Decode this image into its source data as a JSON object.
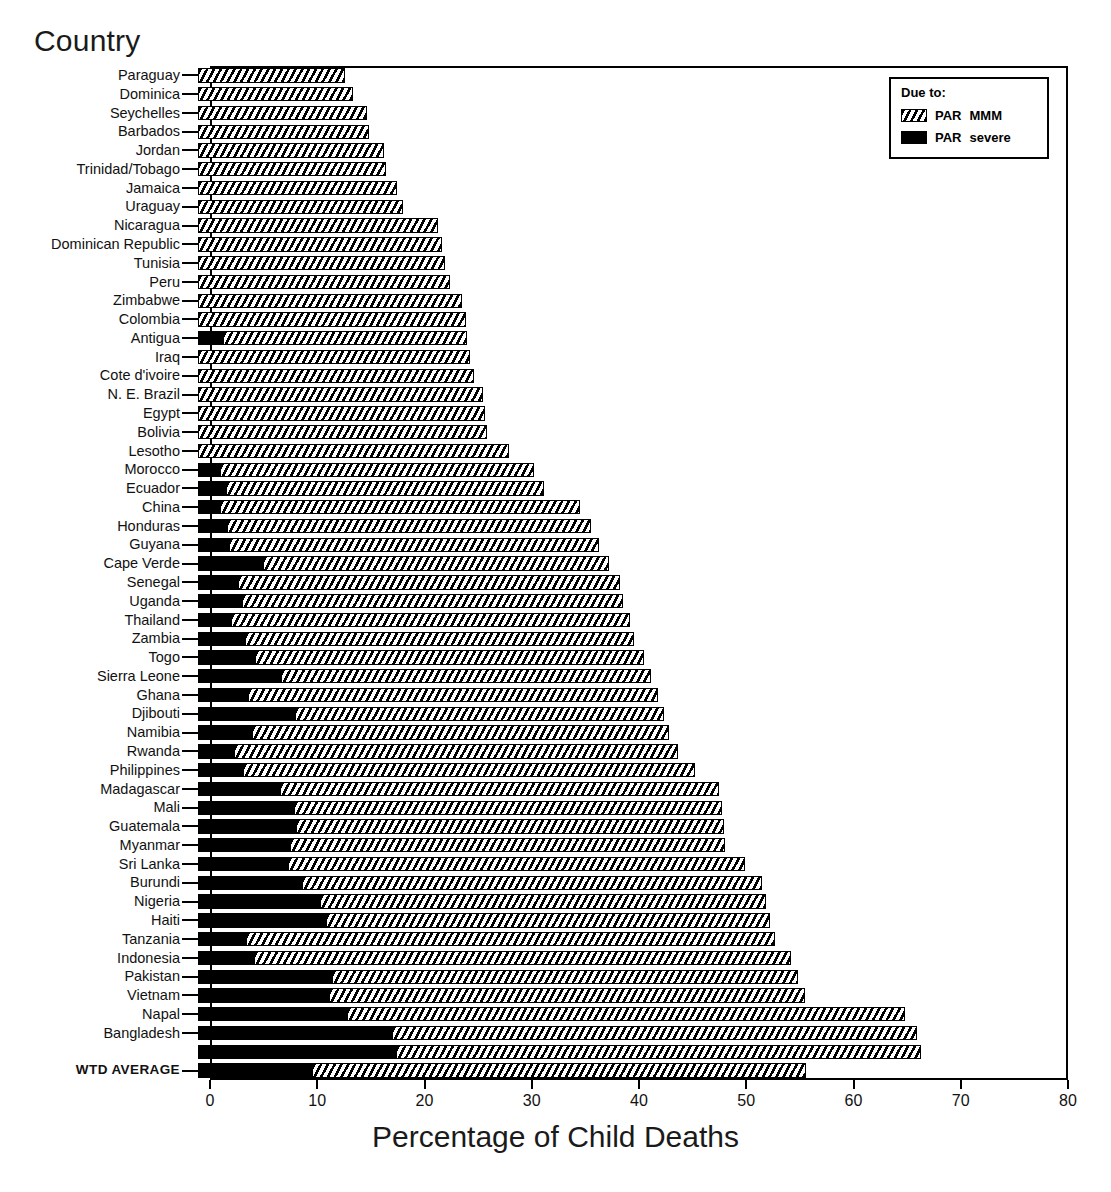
{
  "y_axis_title": "Country",
  "x_axis_title": "Percentage of Child Deaths",
  "legend": {
    "title": "Due to:",
    "items": [
      {
        "name": "PAR",
        "qualifier": "MMM",
        "style": "hatched"
      },
      {
        "name": "PAR",
        "qualifier": "severe",
        "style": "solid-black"
      }
    ]
  },
  "chart_data": {
    "type": "bar",
    "orientation": "horizontal",
    "stacked": true,
    "title": "",
    "xlabel": "Percentage of Child Deaths",
    "ylabel": "Country",
    "xlim": [
      0,
      80
    ],
    "xticks": [
      0,
      10,
      20,
      30,
      40,
      50,
      60,
      70,
      80
    ],
    "grid": false,
    "legend_position": "top-right",
    "series": [
      {
        "name": "PAR severe",
        "style": "solid-black"
      },
      {
        "name": "PAR MMM",
        "style": "hatched"
      }
    ],
    "categories": [
      "Paraguay",
      "Dominica",
      "Seychelles",
      "Barbados",
      "Jordan",
      "Trinidad/Tobago",
      "Jamaica",
      "Uraguay",
      "Nicaragua",
      "Dominican Republic",
      "Tunisia",
      "Peru",
      "Zimbabwe",
      "Colombia",
      "Antigua",
      "Iraq",
      "Cote d'ivoire",
      "N. E. Brazil",
      "Egypt",
      "Bolivia",
      "Lesotho",
      "Morocco",
      "Ecuador",
      "China",
      "Honduras",
      "Guyana",
      "Cape Verde",
      "Senegal",
      "Uganda",
      "Thailand",
      "Zambia",
      "Togo",
      "Sierra Leone",
      "Ghana",
      "Djibouti",
      "Namibia",
      "Rwanda",
      "Philippines",
      "Madagascar",
      "Mali",
      "Guatemala",
      "Myanmar",
      "Sri Lanka",
      "Burundi",
      "Nigeria",
      "Haiti",
      "Tanzania",
      "Indonesia",
      "Pakistan",
      "Vietnam",
      "Napal",
      "Bangladesh",
      "",
      "WTD AVERAGE"
    ],
    "rows": [
      {
        "category": "Paraguay",
        "severe": 0.0,
        "mmm": 12.6,
        "total": 12.6
      },
      {
        "category": "Dominica",
        "severe": 0.0,
        "mmm": 13.3,
        "total": 13.3
      },
      {
        "category": "Seychelles",
        "severe": 0.0,
        "mmm": 14.6,
        "total": 14.6
      },
      {
        "category": "Barbados",
        "severe": 0.0,
        "mmm": 14.8,
        "total": 14.8
      },
      {
        "category": "Jordan",
        "severe": 0.0,
        "mmm": 16.2,
        "total": 16.2
      },
      {
        "category": "Trinidad/Tobago",
        "severe": 0.0,
        "mmm": 16.4,
        "total": 16.4
      },
      {
        "category": "Jamaica",
        "severe": 0.0,
        "mmm": 17.4,
        "total": 17.4
      },
      {
        "category": "Uraguay",
        "severe": 0.0,
        "mmm": 18.0,
        "total": 18.0
      },
      {
        "category": "Nicaragua",
        "severe": 0.0,
        "mmm": 21.3,
        "total": 21.3
      },
      {
        "category": "Dominican Republic",
        "severe": 0.0,
        "mmm": 21.6,
        "total": 21.6
      },
      {
        "category": "Tunisia",
        "severe": 0.0,
        "mmm": 21.9,
        "total": 21.9
      },
      {
        "category": "Peru",
        "severe": 0.0,
        "mmm": 22.4,
        "total": 22.4
      },
      {
        "category": "Zimbabwe",
        "severe": 0.0,
        "mmm": 23.5,
        "total": 23.5
      },
      {
        "category": "Colombia",
        "severe": 0.0,
        "mmm": 23.9,
        "total": 23.9
      },
      {
        "category": "Antigua",
        "severe": 1.2,
        "mmm": 22.8,
        "total": 24.0
      },
      {
        "category": "Iraq",
        "severe": 0.0,
        "mmm": 24.2,
        "total": 24.2
      },
      {
        "category": "Cote d'ivoire",
        "severe": 0.0,
        "mmm": 24.6,
        "total": 24.6
      },
      {
        "category": "N. E. Brazil",
        "severe": 0.0,
        "mmm": 25.5,
        "total": 25.5
      },
      {
        "category": "Egypt",
        "severe": 0.0,
        "mmm": 25.6,
        "total": 25.6
      },
      {
        "category": "Bolivia",
        "severe": 0.0,
        "mmm": 25.8,
        "total": 25.8
      },
      {
        "category": "Lesotho",
        "severe": 0.0,
        "mmm": 27.9,
        "total": 27.9
      },
      {
        "category": "Morocco",
        "severe": 0.9,
        "mmm": 29.3,
        "total": 30.2
      },
      {
        "category": "Ecuador",
        "severe": 1.5,
        "mmm": 29.6,
        "total": 31.1
      },
      {
        "category": "China",
        "severe": 0.9,
        "mmm": 33.6,
        "total": 34.5
      },
      {
        "category": "Honduras",
        "severe": 1.6,
        "mmm": 33.9,
        "total": 35.5
      },
      {
        "category": "Guyana",
        "severe": 1.8,
        "mmm": 34.5,
        "total": 36.3
      },
      {
        "category": "Cape Verde",
        "severe": 4.9,
        "mmm": 32.3,
        "total": 37.2
      },
      {
        "category": "Senegal",
        "severe": 2.6,
        "mmm": 35.6,
        "total": 38.2
      },
      {
        "category": "Uganda",
        "severe": 3.0,
        "mmm": 35.5,
        "total": 38.5
      },
      {
        "category": "Thailand",
        "severe": 2.0,
        "mmm": 37.2,
        "total": 39.2
      },
      {
        "category": "Zambia",
        "severe": 3.3,
        "mmm": 36.2,
        "total": 39.5
      },
      {
        "category": "Togo",
        "severe": 4.2,
        "mmm": 36.3,
        "total": 40.5
      },
      {
        "category": "Sierra Leone",
        "severe": 6.6,
        "mmm": 34.5,
        "total": 41.1
      },
      {
        "category": "Ghana",
        "severe": 3.5,
        "mmm": 38.3,
        "total": 41.8
      },
      {
        "category": "Djibouti",
        "severe": 7.9,
        "mmm": 34.4,
        "total": 42.3
      },
      {
        "category": "Namibia",
        "severe": 3.9,
        "mmm": 38.9,
        "total": 42.8
      },
      {
        "category": "Rwanda",
        "severe": 2.2,
        "mmm": 41.4,
        "total": 43.6
      },
      {
        "category": "Philippines",
        "severe": 3.1,
        "mmm": 42.1,
        "total": 45.2
      },
      {
        "category": "Madagascar",
        "severe": 6.5,
        "mmm": 41.0,
        "total": 47.5
      },
      {
        "category": "Mali",
        "severe": 7.8,
        "mmm": 39.9,
        "total": 47.7
      },
      {
        "category": "Guatemala",
        "severe": 8.0,
        "mmm": 39.9,
        "total": 47.9
      },
      {
        "category": "Myanmar",
        "severe": 7.5,
        "mmm": 40.5,
        "total": 48.0
      },
      {
        "category": "Sri Lanka",
        "severe": 7.3,
        "mmm": 42.6,
        "total": 49.9
      },
      {
        "category": "Burundi",
        "severe": 8.6,
        "mmm": 42.9,
        "total": 51.5
      },
      {
        "category": "Nigeria",
        "severe": 10.3,
        "mmm": 41.5,
        "total": 51.8
      },
      {
        "category": "Haiti",
        "severe": 10.8,
        "mmm": 41.4,
        "total": 52.2
      },
      {
        "category": "Tanzania",
        "severe": 3.4,
        "mmm": 49.3,
        "total": 52.7
      },
      {
        "category": "Indonesia",
        "severe": 4.1,
        "mmm": 50.1,
        "total": 54.2
      },
      {
        "category": "Pakistan",
        "severe": 11.4,
        "mmm": 43.4,
        "total": 54.8
      },
      {
        "category": "Vietnam",
        "severe": 11.1,
        "mmm": 44.4,
        "total": 55.5
      },
      {
        "category": "Napal",
        "severe": 12.8,
        "mmm": 52.0,
        "total": 64.8
      },
      {
        "category": "Bangladesh",
        "severe": 17.0,
        "mmm": 48.9,
        "total": 65.9
      },
      {
        "category": "",
        "severe": 17.3,
        "mmm": 49.0,
        "total": 66.3
      },
      {
        "category": "WTD AVERAGE",
        "severe": 9.5,
        "mmm": 46.1,
        "total": 55.6
      }
    ]
  }
}
